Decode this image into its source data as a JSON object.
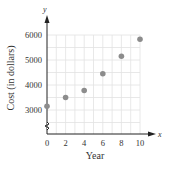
{
  "chart_data": {
    "type": "scatter",
    "title": "",
    "xlabel": "Year",
    "ylabel": "Cost (in dollars)",
    "x_axis_letter": "x",
    "y_axis_letter": "y",
    "x": [
      0,
      2,
      4,
      6,
      8,
      10
    ],
    "y": [
      3150,
      3500,
      3780,
      4450,
      5150,
      5830
    ],
    "x_ticks": [
      "0",
      "2",
      "4",
      "6",
      "8",
      "10"
    ],
    "y_ticks": [
      "3000",
      "4000",
      "5000",
      "6000"
    ],
    "xlim": [
      0,
      11
    ],
    "ylim": [
      2500,
      6400
    ],
    "y_axis_break": true,
    "grid": true,
    "point_color": "#8c8c8c",
    "legend": null
  }
}
